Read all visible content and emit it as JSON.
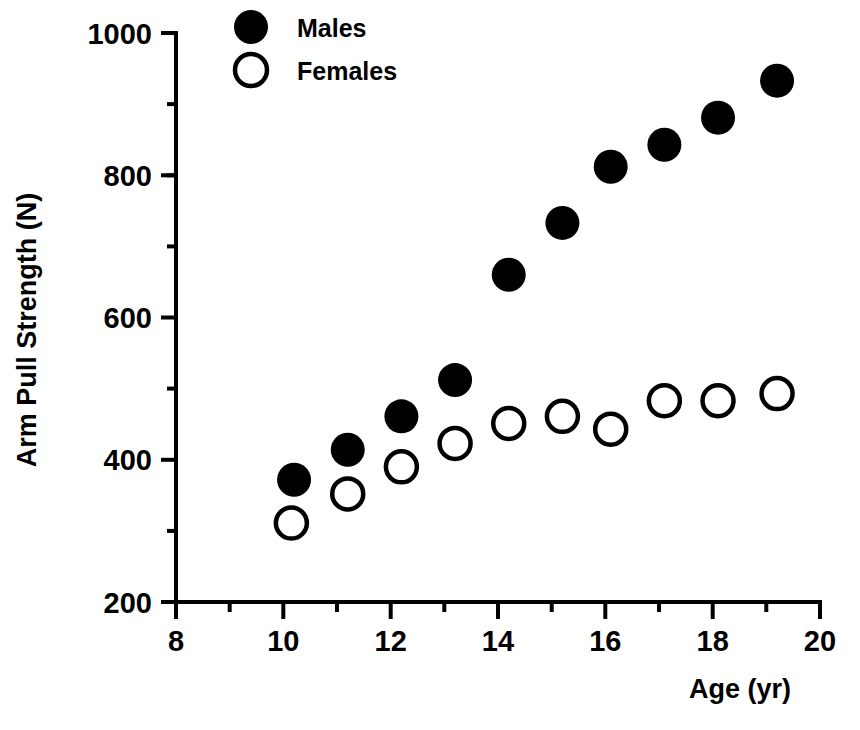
{
  "chart_data": {
    "type": "scatter",
    "title": "",
    "xlabel": "Age  (yr)",
    "ylabel": "Arm Pull Strength (N)",
    "xlim": [
      8,
      20
    ],
    "ylim": [
      200,
      1000
    ],
    "x_major_ticks": [
      8,
      10,
      12,
      14,
      16,
      18,
      20
    ],
    "x_minor_ticks": [
      9,
      11,
      13,
      15,
      17,
      19
    ],
    "x_tick_labels": [
      "8",
      "10",
      "12",
      "14",
      "16",
      "18",
      "20"
    ],
    "y_major_ticks": [
      200,
      400,
      600,
      800,
      1000
    ],
    "y_minor_ticks": [
      300,
      500,
      700,
      900
    ],
    "y_tick_labels": [
      "200",
      "400",
      "600",
      "800",
      "1000"
    ],
    "grid": false,
    "legend_position": "top-center",
    "marker_colors": {
      "males": "#000000",
      "females": "#ffffff",
      "females_edge": "#000000"
    },
    "series": [
      {
        "name": "Males",
        "marker": "filled-circle",
        "x": [
          10.2,
          11.2,
          12.2,
          13.2,
          14.2,
          15.2,
          16.1,
          17.1,
          18.1,
          19.2
        ],
        "y": [
          372,
          414,
          461,
          512,
          660,
          733,
          812,
          843,
          881,
          933
        ]
      },
      {
        "name": "Females",
        "marker": "open-circle",
        "x": [
          10.15,
          11.2,
          12.2,
          13.2,
          14.2,
          15.2,
          16.1,
          17.1,
          18.1,
          19.2
        ],
        "y": [
          311,
          352,
          390,
          423,
          451,
          461,
          443,
          483,
          483,
          493
        ]
      }
    ]
  },
  "legend": {
    "entries": [
      {
        "label": "Males",
        "marker": "filled-circle"
      },
      {
        "label": "Females",
        "marker": "open-circle"
      }
    ]
  },
  "axes": {
    "x_title": "Age  (yr)",
    "y_title": "Arm Pull Strength (N)"
  }
}
